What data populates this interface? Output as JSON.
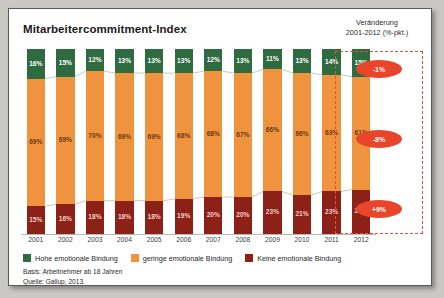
{
  "title": "Mitarbeitercommitment-Index",
  "right_header": {
    "line1": "Veränderung",
    "line2": "2001-2012 (%-pkt.)"
  },
  "legend": [
    {
      "label": "Hohe emotionale Bindung",
      "color": "#2e6b41",
      "name": "legend-hohe"
    },
    {
      "label": "geringe emotionale Bindung",
      "color": "#f0933f",
      "name": "legend-geringe"
    },
    {
      "label": "Keine emotionale Bindung",
      "color": "#8c2118",
      "name": "legend-keine"
    }
  ],
  "change_badges": [
    {
      "value": "-1%",
      "series": "Hohe emotionale Bindung"
    },
    {
      "value": "-8%",
      "series": "geringe emotionale Bindung"
    },
    {
      "value": "+9%",
      "series": "Keine emotionale Bindung"
    }
  ],
  "footnote": {
    "basis": "Basis: Arbeitnehmer ab 18 Jahren",
    "source": "Quelle: Gallup, 2013."
  },
  "chart_data": {
    "type": "bar",
    "stacked": true,
    "stack_total": 100,
    "title": "Mitarbeitercommitment-Index",
    "xlabel": "",
    "ylabel": "",
    "ylim": [
      0,
      100
    ],
    "grid": false,
    "legend_position": "bottom",
    "categories": [
      "2001",
      "2002",
      "2003",
      "2004",
      "2005",
      "2006",
      "2007",
      "2008",
      "2009",
      "2010",
      "2011",
      "2012"
    ],
    "series": [
      {
        "name": "Hohe emotionale Bindung",
        "color": "#2e6b41",
        "values": [
          16,
          15,
          12,
          13,
          13,
          13,
          12,
          13,
          11,
          13,
          14,
          15
        ],
        "labels": [
          "16%",
          "15%",
          "12%",
          "13%",
          "13%",
          "13%",
          "12%",
          "13%",
          "11%",
          "13%",
          "14%",
          "15%"
        ]
      },
      {
        "name": "geringe emotionale Bindung",
        "color": "#f0933f",
        "values": [
          69,
          69,
          70,
          69,
          69,
          68,
          68,
          67,
          66,
          66,
          63,
          61
        ],
        "labels": [
          "69%",
          "69%",
          "70%",
          "69%",
          "69%",
          "68%",
          "68%",
          "67%",
          "66%",
          "66%",
          "63%",
          "61%"
        ]
      },
      {
        "name": "Keine emotionale Bindung",
        "color": "#8c2118",
        "values": [
          15,
          16,
          18,
          18,
          18,
          19,
          20,
          20,
          23,
          21,
          23,
          24
        ],
        "labels": [
          "15%",
          "16%",
          "18%",
          "18%",
          "18%",
          "19%",
          "20%",
          "20%",
          "23%",
          "21%",
          "23%",
          "24%"
        ]
      }
    ],
    "annotations": [
      {
        "text": "-1%",
        "for": "Hohe emotionale Bindung"
      },
      {
        "text": "-8%",
        "for": "geringe emotionale Bindung"
      },
      {
        "text": "+9%",
        "for": "Keine emotionale Bindung"
      }
    ]
  }
}
